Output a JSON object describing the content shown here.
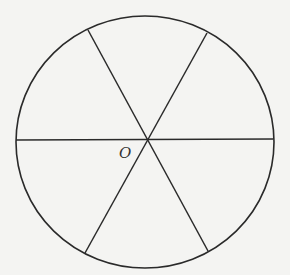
{
  "diagram": {
    "type": "circle divided into six equal sectors by three diameters",
    "center": {
      "x": 147,
      "y": 140,
      "label": "O"
    },
    "circle": {
      "rx": 129,
      "ry": 126,
      "stroke": "#2a2a2a"
    },
    "diameters": [
      {
        "name": "horizontal",
        "x1": 16,
        "y1": 140,
        "x2": 273,
        "y2": 139
      },
      {
        "name": "upper-left-to-lower-right",
        "x1": 88,
        "y1": 30,
        "x2": 208,
        "y2": 251
      },
      {
        "name": "upper-right-to-lower-left",
        "x1": 207,
        "y1": 33,
        "x2": 85,
        "y2": 253
      }
    ],
    "background": "#f4f4f2"
  }
}
